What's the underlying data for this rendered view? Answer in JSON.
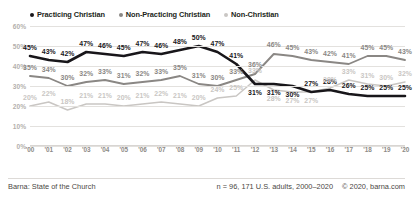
{
  "legend": {
    "items": [
      {
        "label": "Practicing Christian",
        "color": "#18161a",
        "key": "practicing"
      },
      {
        "label": "Non-Practicing Christian",
        "color": "#8a8784",
        "key": "nonpracticing"
      },
      {
        "label": "Non-Christian",
        "color": "#c9c6c3",
        "key": "nonchristian"
      }
    ]
  },
  "footer": {
    "source": "Barna: State of the Church",
    "sample_n": "n = 96, 171 U.S. adults, 2000–2020",
    "copyright": "© 2020, barna.com"
  },
  "chart_data": {
    "type": "line",
    "title": "",
    "xlabel": "",
    "ylabel": "",
    "ylim": [
      0,
      60
    ],
    "yticks": [
      "0%",
      "10%",
      "20%",
      "30%",
      "40%",
      "50%",
      "60%"
    ],
    "ytick_values": [
      0,
      10,
      20,
      30,
      40,
      50,
      60
    ],
    "grid": true,
    "legend_position": "top-left",
    "categories": [
      "2000",
      "2001",
      "2002",
      "2003",
      "2004",
      "2005",
      "2006",
      "2007",
      "2008",
      "2009",
      "2010",
      "2011",
      "2012",
      "2013",
      "2014",
      "2015",
      "2016",
      "2017",
      "2018",
      "2019",
      "2020"
    ],
    "tick_labels": [
      "'00",
      "'01",
      "'02",
      "'03",
      "'04",
      "'05",
      "'06",
      "'07",
      "'08",
      "'09",
      "'10",
      "'11",
      "'12",
      "'13",
      "'14",
      "'15",
      "'16",
      "'17",
      "'18",
      "'19",
      "'20"
    ],
    "series": [
      {
        "name": "Practicing Christian",
        "color": "#18161a",
        "values": [
          45,
          43,
          42,
          47,
          46,
          45,
          47,
          46,
          48,
          50,
          47,
          41,
          31,
          31,
          30,
          27,
          28,
          26,
          25,
          25,
          25
        ],
        "labels": [
          "45%",
          "43%",
          "42%",
          "47%",
          "46%",
          "45%",
          "47%",
          "46%",
          "48%",
          "50%",
          "47%",
          "41%",
          "31%",
          "31%",
          "30%",
          "27%",
          "28%",
          "26%",
          "25%",
          "25%",
          "25%"
        ]
      },
      {
        "name": "Non-Practicing Christian",
        "color": "#8a8784",
        "values": [
          35,
          34,
          30,
          32,
          33,
          31,
          32,
          33,
          35,
          31,
          30,
          33,
          36,
          46,
          45,
          43,
          42,
          41,
          45,
          45,
          43
        ],
        "labels": [
          "35%",
          "34%",
          "30%",
          "32%",
          "33%",
          "31%",
          "32%",
          "33%",
          "35%",
          "31%",
          "30%",
          "33%",
          "36%",
          "46%",
          "45%",
          "43%",
          "42%",
          "41%",
          "45%",
          "45%",
          "43%"
        ]
      },
      {
        "name": "Non-Christian",
        "color": "#c9c6c3",
        "values": [
          20,
          22,
          18,
          21,
          21,
          20,
          21,
          22,
          21,
          20,
          24,
          25,
          33,
          28,
          27,
          27,
          29,
          33,
          31,
          30,
          32
        ],
        "labels": [
          "20%",
          "22%",
          "18%",
          "21%",
          "21%",
          "20%",
          "21%",
          "22%",
          "21%",
          "20%",
          "24%",
          "25%",
          "33%",
          "28%",
          "27%",
          "27%",
          "29%",
          "33%",
          "31%",
          "30%",
          "32%"
        ]
      }
    ]
  }
}
